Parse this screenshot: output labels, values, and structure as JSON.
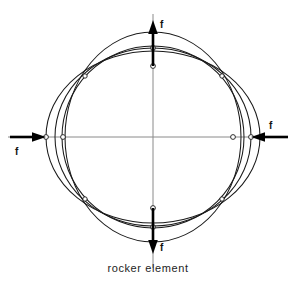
{
  "figure": {
    "caption": "rocker element",
    "background_color": "#ffffff",
    "curve_color": "#1a1a1a",
    "axis_color": "#8a8a8a",
    "arrow_color": "#000000"
  },
  "center": {
    "x": 153,
    "y": 137
  },
  "axes": {
    "horizontal": {
      "x1": 8,
      "y1": 137,
      "x2": 288,
      "y2": 137
    },
    "vertical": {
      "x1": 153,
      "y1": 14,
      "x2": 153,
      "y2": 268
    }
  },
  "forces": [
    {
      "name": "force-top",
      "label": "f",
      "direction": "up",
      "tip_x": 153,
      "tip_y": 20,
      "tail_x": 153,
      "tail_y": 66
    },
    {
      "name": "force-bottom",
      "label": "f",
      "direction": "down",
      "tip_x": 153,
      "tip_y": 254,
      "tail_x": 153,
      "tail_y": 208
    },
    {
      "name": "force-left",
      "label": "f",
      "direction": "right",
      "tip_x": 46,
      "tip_y": 137,
      "tail_x": 10,
      "tail_y": 137
    },
    {
      "name": "force-right",
      "label": "f",
      "direction": "left",
      "tip_x": 251,
      "tip_y": 137,
      "tail_x": 288,
      "tail_y": 137
    }
  ],
  "curves": [
    {
      "name": "reference-circle",
      "type": "circle",
      "cx": 153,
      "cy": 137,
      "rx": 91,
      "ry": 91,
      "rotation": 0
    },
    {
      "name": "mode-ellipse-a",
      "type": "ellipse",
      "cx": 153,
      "cy": 137,
      "rx": 107,
      "ry": 86,
      "rotation": 90
    },
    {
      "name": "mode-ellipse-b",
      "type": "ellipse",
      "cx": 153,
      "cy": 137,
      "rx": 105,
      "ry": 88,
      "rotation": 0
    },
    {
      "name": "mode-ellipse-c",
      "type": "ellipse",
      "cx": 153,
      "cy": 137,
      "rx": 98,
      "ry": 89,
      "rotation": 90
    }
  ],
  "nodes": [
    {
      "name": "node-top-outer",
      "x": 153,
      "y": 48
    },
    {
      "name": "node-top-inner",
      "x": 153,
      "y": 66
    },
    {
      "name": "node-bottom-outer",
      "x": 153,
      "y": 227
    },
    {
      "name": "node-bottom-inner",
      "x": 153,
      "y": 208
    },
    {
      "name": "node-left-outer",
      "x": 46,
      "y": 137
    },
    {
      "name": "node-left-inner",
      "x": 63,
      "y": 137
    },
    {
      "name": "node-right-outer",
      "x": 251,
      "y": 137
    },
    {
      "name": "node-right-inner",
      "x": 233,
      "y": 137
    },
    {
      "name": "node-diag-ne",
      "x": 222,
      "y": 76
    },
    {
      "name": "node-diag-nw",
      "x": 85,
      "y": 76
    },
    {
      "name": "node-diag-se",
      "x": 222,
      "y": 199
    },
    {
      "name": "node-diag-sw",
      "x": 85,
      "y": 199
    }
  ]
}
